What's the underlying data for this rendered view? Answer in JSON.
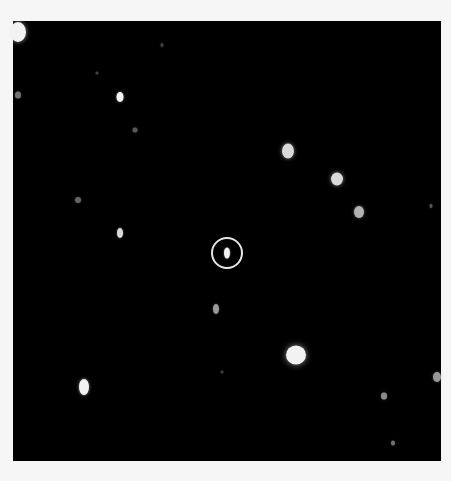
{
  "image": {
    "background_color": "#f6f6f6",
    "field_color": "#000000",
    "field": {
      "x": 13,
      "y": 21,
      "width": 428,
      "height": 440
    },
    "marker": {
      "cx": 227,
      "cy": 253,
      "r": 16,
      "color": "#e6e6e6"
    },
    "spots": [
      {
        "cx": 18,
        "cy": 32,
        "w": 16,
        "h": 20,
        "brightness": 0.95
      },
      {
        "cx": 18,
        "cy": 95,
        "w": 6,
        "h": 7,
        "brightness": 0.45
      },
      {
        "cx": 97,
        "cy": 73,
        "w": 3,
        "h": 3,
        "brightness": 0.25
      },
      {
        "cx": 120,
        "cy": 97,
        "w": 7,
        "h": 10,
        "brightness": 0.95
      },
      {
        "cx": 135,
        "cy": 130,
        "w": 5,
        "h": 5,
        "brightness": 0.35
      },
      {
        "cx": 162,
        "cy": 45,
        "w": 3,
        "h": 4,
        "brightness": 0.25
      },
      {
        "cx": 288,
        "cy": 151,
        "w": 12,
        "h": 15,
        "brightness": 0.85
      },
      {
        "cx": 337,
        "cy": 179,
        "w": 12,
        "h": 13,
        "brightness": 0.85
      },
      {
        "cx": 359,
        "cy": 212,
        "w": 10,
        "h": 12,
        "brightness": 0.7
      },
      {
        "cx": 431,
        "cy": 206,
        "w": 3,
        "h": 4,
        "brightness": 0.35
      },
      {
        "cx": 78,
        "cy": 200,
        "w": 6,
        "h": 6,
        "brightness": 0.4
      },
      {
        "cx": 120,
        "cy": 233,
        "w": 6,
        "h": 10,
        "brightness": 0.85
      },
      {
        "cx": 227,
        "cy": 253,
        "w": 6,
        "h": 11,
        "brightness": 0.95
      },
      {
        "cx": 216,
        "cy": 309,
        "w": 6,
        "h": 10,
        "brightness": 0.6
      },
      {
        "cx": 296,
        "cy": 355,
        "w": 20,
        "h": 19,
        "brightness": 0.95
      },
      {
        "cx": 222,
        "cy": 372,
        "w": 3,
        "h": 3,
        "brightness": 0.25
      },
      {
        "cx": 84,
        "cy": 387,
        "w": 10,
        "h": 16,
        "brightness": 0.95
      },
      {
        "cx": 437,
        "cy": 377,
        "w": 8,
        "h": 10,
        "brightness": 0.6
      },
      {
        "cx": 384,
        "cy": 396,
        "w": 6,
        "h": 7,
        "brightness": 0.55
      },
      {
        "cx": 393,
        "cy": 443,
        "w": 4,
        "h": 5,
        "brightness": 0.45
      }
    ]
  }
}
